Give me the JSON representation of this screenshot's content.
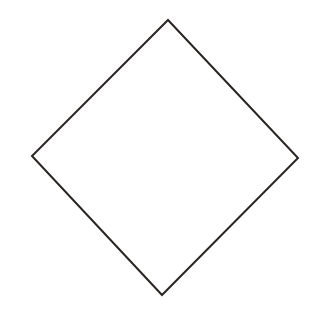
{
  "figure": {
    "shape": "diamond",
    "vertices": {
      "top": [
        168,
        20
      ],
      "right": [
        298,
        158
      ],
      "bottom": [
        162,
        295
      ],
      "left": [
        32,
        156
      ]
    },
    "stroke_color": "#2a2522",
    "stroke_width": 2,
    "fill_color": "#ffffff",
    "background_color": "#ffffff"
  }
}
